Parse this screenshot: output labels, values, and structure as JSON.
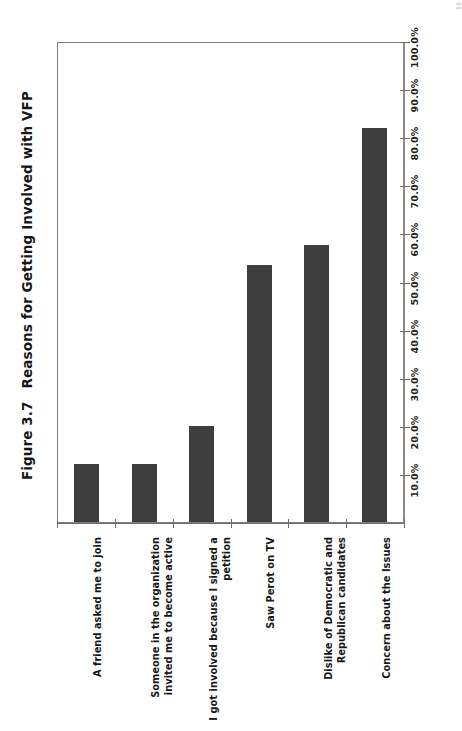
{
  "page": {
    "page_mark": "55"
  },
  "figure": {
    "number": "Figure 3.7",
    "title": "Reasons for Getting Involved with VFP",
    "full_title": "Figure 3.7   Reasons for Getting Involved with VFP"
  },
  "axis": {
    "value_axis_ticks": [
      "10.0%",
      "20.0%",
      "30.0%",
      "40.0%",
      "50.0%",
      "60.0%",
      "70.0%",
      "80.0%",
      "90.0%",
      "100.0%"
    ]
  },
  "colors": {
    "bar_fill": "#3d3d3d",
    "axis": "#6e6e6e",
    "frame": "#7d7d7d",
    "text": "#1b1b1b",
    "background": "#ffffff"
  },
  "chart_data": {
    "type": "bar",
    "orientation": "vertical",
    "title": "Figure 3.7   Reasons for Getting Involved with VFP",
    "xlabel": "",
    "ylabel": "",
    "ylim": [
      0,
      100
    ],
    "ytick_values": [
      10,
      20,
      30,
      40,
      50,
      60,
      70,
      80,
      90,
      100
    ],
    "ytick_labels": [
      "10.0%",
      "20.0%",
      "30.0%",
      "40.0%",
      "50.0%",
      "60.0%",
      "70.0%",
      "80.0%",
      "90.0%",
      "100.0%"
    ],
    "grid": false,
    "legend": null,
    "categories": [
      "A friend asked me to join",
      "Someone in the organization invited me to become active",
      "I got involved because I signed a petition",
      "Saw Perot on TV",
      "Dislike of Democratic and Republican candidates",
      "Concern about the Issues"
    ],
    "values": [
      12,
      12,
      20,
      53.5,
      57.5,
      82
    ],
    "value_unit": "%"
  }
}
